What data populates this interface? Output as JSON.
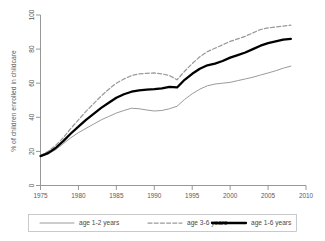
{
  "chart_data": {
    "type": "line",
    "title": "",
    "xlabel": "",
    "ylabel": "% of children enrolled in childcare",
    "xlim": [
      1975,
      2010
    ],
    "ylim": [
      0,
      100
    ],
    "grid": false,
    "legend_position": "bottom",
    "xticks": [
      "1975",
      "1980",
      "1985",
      "1990",
      "1995",
      "2000",
      "2005",
      "2010"
    ],
    "xtick_values": [
      1975,
      1980,
      1985,
      1990,
      1995,
      2000,
      2005,
      2010
    ],
    "yticks": [
      "0",
      "20",
      "40",
      "60",
      "80",
      "100"
    ],
    "ytick_values": [
      0,
      20,
      40,
      60,
      80,
      100
    ],
    "x": [
      1975,
      1976,
      1977,
      1978,
      1979,
      1980,
      1981,
      1982,
      1983,
      1984,
      1985,
      1986,
      1987,
      1988,
      1989,
      1990,
      1991,
      1992,
      1993,
      1994,
      1995,
      1996,
      1997,
      1998,
      1999,
      2000,
      2001,
      2002,
      2003,
      2004,
      2005,
      2006,
      2007,
      2008
    ],
    "series": [
      {
        "name": "age 1-2 years",
        "style": "solid-thin",
        "color": "#9a9a9a",
        "values": [
          17.0,
          18.5,
          21.0,
          24.5,
          28.0,
          31.0,
          33.5,
          36.0,
          38.5,
          40.5,
          42.5,
          44.0,
          45.3,
          45.0,
          44.3,
          43.7,
          44.0,
          45.0,
          46.5,
          50.5,
          53.8,
          56.5,
          58.5,
          59.5,
          60.0,
          60.5,
          61.5,
          62.5,
          63.5,
          64.8,
          66.0,
          67.3,
          68.8,
          70.0
        ]
      },
      {
        "name": "age 3-6 years",
        "style": "dashed",
        "color": "#9a9a9a",
        "values": [
          17.5,
          20.0,
          23.5,
          28.0,
          33.5,
          38.5,
          43.5,
          48.0,
          52.5,
          56.5,
          60.0,
          62.5,
          64.5,
          65.5,
          65.8,
          66.0,
          65.5,
          64.5,
          62.0,
          67.0,
          71.5,
          75.5,
          78.5,
          80.5,
          82.5,
          84.5,
          86.0,
          87.5,
          89.5,
          91.5,
          92.5,
          93.0,
          93.5,
          94.0
        ]
      },
      {
        "name": "age 1-6 years",
        "style": "solid-thick",
        "color": "#000000",
        "values": [
          17.2,
          19.0,
          22.0,
          26.0,
          30.5,
          34.5,
          38.5,
          42.0,
          45.5,
          48.5,
          51.5,
          53.5,
          55.0,
          55.8,
          56.2,
          56.5,
          57.0,
          57.8,
          57.5,
          62.0,
          65.5,
          68.5,
          70.5,
          71.5,
          73.0,
          75.0,
          76.5,
          78.0,
          80.0,
          82.0,
          83.5,
          84.5,
          85.5,
          86.0
        ]
      }
    ]
  },
  "legend": {
    "items": [
      {
        "label": "age 1-2 years",
        "swatch": "line-swatch-thin-gray"
      },
      {
        "label": "age 3-6 years",
        "swatch": "line-swatch-dashed-gray"
      },
      {
        "label": "age 1-6 years",
        "swatch": "line-swatch-thick-black"
      }
    ]
  }
}
